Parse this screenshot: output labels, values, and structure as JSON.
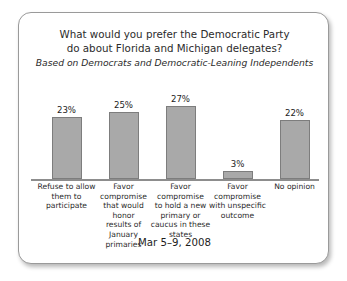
{
  "chart_data": {
    "type": "bar",
    "title": "What would you prefer the Democratic Party do about Florida and Michigan delegates?",
    "title_lines": [
      "What would you prefer the Democratic Party",
      "do about Florida and Michigan delegates?"
    ],
    "subtitle": "Based on Democrats and Democratic-Leaning Independents",
    "categories": [
      "Refuse to allow them to participate",
      "Favor compromise that would honor results of January primaries",
      "Favor compromise to hold a new primary or caucus in these states",
      "Favor compromise with unspecific outcome",
      "No opinion"
    ],
    "category_lines": [
      [
        "Refuse to allow",
        "them to",
        "participate"
      ],
      [
        "Favor",
        "compromise",
        "that would honor",
        "results of January",
        "primaries"
      ],
      [
        "Favor",
        "compromise",
        "to hold a new",
        "primary or",
        "caucus in these",
        "states"
      ],
      [
        "Favor",
        "compromise",
        "with unspecific",
        "outcome"
      ],
      [
        "No opinion"
      ]
    ],
    "values": [
      23,
      25,
      27,
      3,
      22
    ],
    "value_labels": [
      "23%",
      "25%",
      "27%",
      "3%",
      "22%"
    ],
    "xlabel": "",
    "ylabel": "",
    "ylim": [
      0,
      30
    ],
    "grid": false,
    "legend": false,
    "bar_color": "#a9a9a9",
    "bar_border_color": "#7d7d7d"
  },
  "footer": {
    "date": "Mar 5–9, 2008"
  }
}
